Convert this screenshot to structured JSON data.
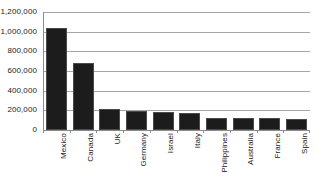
{
  "chart_data": {
    "type": "bar",
    "title": "",
    "subtitle": "",
    "xlabel": "",
    "ylabel": "",
    "categories": [
      "Mexico",
      "Canada",
      "UK",
      "Germany",
      "Israel",
      "Italy",
      "Philippines",
      "Australia",
      "France",
      "Spain"
    ],
    "values": [
      1040000,
      680000,
      215000,
      190000,
      180000,
      170000,
      125000,
      120000,
      118000,
      112000
    ],
    "ylim": [
      0,
      1200000
    ],
    "ytick_values": [
      0,
      200000,
      400000,
      600000,
      800000,
      1000000,
      1200000
    ],
    "ytick_labels": [
      "0",
      "200,000",
      "400,000",
      "600,000",
      "800,000",
      "1,000,000",
      "1,200,000"
    ],
    "grid": true,
    "grid_axis": "y",
    "legend": false,
    "legend_position": "none",
    "bar_color": "#1c1c1c",
    "bar_edge_color": "#4a4a4a",
    "grid_color": "#a6a6a6",
    "axis_color": "#8c8c8c",
    "background_color": "#ffffff",
    "text_color": "#1a1a1a",
    "category_label_rotation": 90
  }
}
